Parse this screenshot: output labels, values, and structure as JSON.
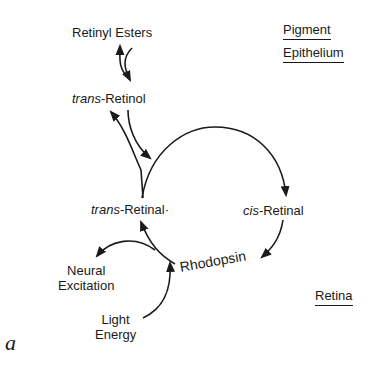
{
  "figure": {
    "panel_label": "a",
    "regions": {
      "pigment_epithelium": [
        "Pigment",
        "Epithelium"
      ],
      "retina": "Retina"
    },
    "nodes": {
      "retinyl_esters": "Retinyl Esters",
      "trans_retinol": {
        "prefix": "trans",
        "suffix": "-Retinol"
      },
      "trans_retinal": {
        "prefix": "trans",
        "suffix": "-Retinal·"
      },
      "cis_retinal": {
        "prefix": "cis",
        "suffix": "-Retinal"
      },
      "rhodopsin": "Rhodopsin",
      "neural_excitation": [
        "Neural",
        "Excitation"
      ],
      "light_energy": [
        "Light",
        "Energy"
      ]
    },
    "edges": [
      {
        "from": "trans-Retinol",
        "to": "Retinyl Esters",
        "type": "reversible"
      },
      {
        "from": "trans-Retinal",
        "to": "trans-Retinol",
        "type": "reversible"
      },
      {
        "from": "trans-Retinal",
        "to": "cis-Retinal",
        "type": "arc"
      },
      {
        "from": "cis-Retinal",
        "to": "Rhodopsin"
      },
      {
        "from": "Rhodopsin",
        "to": "trans-Retinal"
      },
      {
        "from": "Rhodopsin",
        "to": "Neural Excitation"
      },
      {
        "from": "Light Energy",
        "to": "Rhodopsin"
      }
    ],
    "stroke_color": "#1a1a1a"
  }
}
